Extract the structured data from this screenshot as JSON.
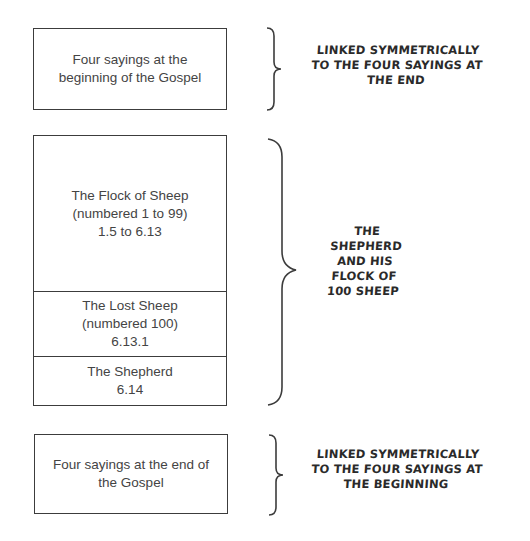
{
  "diagram": {
    "top_box": {
      "text": "Four sayings at the\nbeginning of the Gospel"
    },
    "middle_stack": [
      {
        "text": "The Flock of Sheep\n(numbered 1 to 99)\n1.5 to 6.13"
      },
      {
        "text": "The Lost Sheep\n(numbered 100)\n6.13.1"
      },
      {
        "text": "The Shepherd\n6.14"
      }
    ],
    "bottom_box": {
      "text": "Four sayings at the end of\nthe Gospel"
    },
    "annotations": {
      "top": "LINKED SYMMETRICALLY\nTO THE FOUR SAYINGS AT\nTHE END",
      "middle": "THE\nSHEPHERD\nAND HIS\nFLOCK OF\n100 SHEEP",
      "bottom": "LINKED SYMMETRICALLY\nTO THE FOUR SAYINGS AT\nTHE BEGINNING"
    },
    "colors": {
      "line": "#3c3c3c",
      "text": "#444444",
      "background": "#ffffff"
    }
  }
}
